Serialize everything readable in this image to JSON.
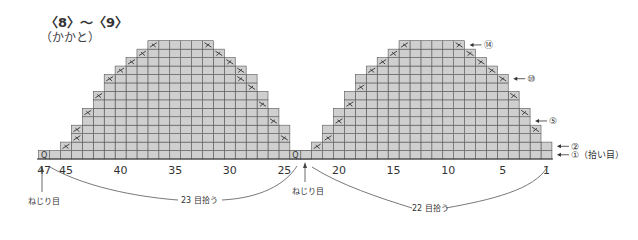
{
  "title": "〈8〉〜〈9〉",
  "subtitle": "（かかと）",
  "stitch_labels": [
    {
      "stitch": 47,
      "text": "47"
    },
    {
      "stitch": 45,
      "text": "45"
    },
    {
      "stitch": 40,
      "text": "40"
    },
    {
      "stitch": 35,
      "text": "35"
    },
    {
      "stitch": 30,
      "text": "30"
    },
    {
      "stitch": 25,
      "text": "25"
    },
    {
      "stitch": 20,
      "text": "20"
    },
    {
      "stitch": 15,
      "text": "15"
    },
    {
      "stitch": 10,
      "text": "10"
    },
    {
      "stitch": 5,
      "text": "5"
    },
    {
      "stitch": 1,
      "text": "1"
    }
  ],
  "row_labels": [
    {
      "row": 14,
      "text": "⑭"
    },
    {
      "row": 10,
      "text": "⑩"
    },
    {
      "row": 5,
      "text": "⑤"
    },
    {
      "row": 2,
      "text": "②"
    },
    {
      "row": 1,
      "text": "①（拾い目）"
    }
  ],
  "annotations": {
    "twist_left": "ねじり目",
    "twist_center": "ねじり目",
    "pickup_left": "23 目拾う",
    "pickup_right": "22 目拾う",
    "twist_symbol": "ߏ"
  },
  "grid": {
    "total_stitches": 47,
    "total_rows": 14,
    "twist_stitches": [
      47,
      24
    ],
    "left_half": {
      "rows": [
        {
          "row": 1,
          "from": 23,
          "to": 46
        },
        {
          "row": 2,
          "from": 25,
          "to": 45
        },
        {
          "row": 3,
          "from": 25,
          "to": 44
        },
        {
          "row": 4,
          "from": 25,
          "to": 44
        },
        {
          "row": 5,
          "from": 26,
          "to": 43
        },
        {
          "row": 6,
          "from": 26,
          "to": 43
        },
        {
          "row": 7,
          "from": 27,
          "to": 42
        },
        {
          "row": 8,
          "from": 27,
          "to": 42
        },
        {
          "row": 9,
          "from": 28,
          "to": 41
        },
        {
          "row": 10,
          "from": 28,
          "to": 41
        },
        {
          "row": 11,
          "from": 29,
          "to": 40
        },
        {
          "row": 12,
          "from": 30,
          "to": 39
        },
        {
          "row": 13,
          "from": 31,
          "to": 38
        },
        {
          "row": 14,
          "from": 32,
          "to": 37
        }
      ],
      "decreases": [
        {
          "row": 2,
          "stitch": 45
        },
        {
          "row": 3,
          "stitch": 44
        },
        {
          "row": 4,
          "stitch": 44
        },
        {
          "row": 6,
          "stitch": 43
        },
        {
          "row": 8,
          "stitch": 42
        },
        {
          "row": 10,
          "stitch": 41
        },
        {
          "row": 11,
          "stitch": 40
        },
        {
          "row": 12,
          "stitch": 39
        },
        {
          "row": 13,
          "stitch": 38
        },
        {
          "row": 14,
          "stitch": 37
        },
        {
          "row": 3,
          "stitch": 25
        },
        {
          "row": 5,
          "stitch": 26
        },
        {
          "row": 7,
          "stitch": 27
        },
        {
          "row": 9,
          "stitch": 28
        },
        {
          "row": 10,
          "stitch": 29
        },
        {
          "row": 11,
          "stitch": 29
        },
        {
          "row": 12,
          "stitch": 30
        },
        {
          "row": 13,
          "stitch": 31
        },
        {
          "row": 14,
          "stitch": 32
        }
      ]
    },
    "right_half": {
      "rows": [
        {
          "row": 1,
          "from": 1,
          "to": 23
        },
        {
          "row": 2,
          "from": 1,
          "to": 22
        },
        {
          "row": 3,
          "from": 2,
          "to": 21
        },
        {
          "row": 4,
          "from": 2,
          "to": 21
        },
        {
          "row": 5,
          "from": 3,
          "to": 20
        },
        {
          "row": 6,
          "from": 3,
          "to": 20
        },
        {
          "row": 7,
          "from": 4,
          "to": 19
        },
        {
          "row": 8,
          "from": 4,
          "to": 19
        },
        {
          "row": 9,
          "from": 5,
          "to": 18
        },
        {
          "row": 10,
          "from": 5,
          "to": 18
        },
        {
          "row": 11,
          "from": 6,
          "to": 17
        },
        {
          "row": 12,
          "from": 7,
          "to": 16
        },
        {
          "row": 13,
          "from": 8,
          "to": 15
        },
        {
          "row": 14,
          "from": 9,
          "to": 14
        }
      ],
      "decreases": [
        {
          "row": 2,
          "stitch": 22
        },
        {
          "row": 3,
          "stitch": 21
        },
        {
          "row": 5,
          "stitch": 20
        },
        {
          "row": 7,
          "stitch": 19
        },
        {
          "row": 9,
          "stitch": 18
        },
        {
          "row": 11,
          "stitch": 17
        },
        {
          "row": 12,
          "stitch": 16
        },
        {
          "row": 13,
          "stitch": 15
        },
        {
          "row": 14,
          "stitch": 14
        },
        {
          "row": 4,
          "stitch": 2
        },
        {
          "row": 6,
          "stitch": 3
        },
        {
          "row": 8,
          "stitch": 4
        },
        {
          "row": 10,
          "stitch": 5
        },
        {
          "row": 11,
          "stitch": 6
        },
        {
          "row": 12,
          "stitch": 7
        },
        {
          "row": 13,
          "stitch": 8
        },
        {
          "row": 14,
          "stitch": 9
        }
      ]
    }
  }
}
